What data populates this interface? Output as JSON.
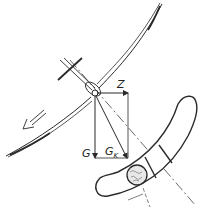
{
  "diagram": {
    "labels": {
      "centrifugal_force": "Z",
      "weight": "G",
      "resultant_main": "G",
      "resultant_sub": "K"
    },
    "colors": {
      "stroke": "#2a2a2a",
      "background": "#ffffff"
    }
  }
}
